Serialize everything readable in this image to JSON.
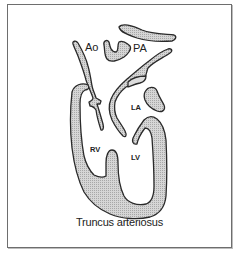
{
  "figure": {
    "caption": "Truncus arteriosus",
    "labels": {
      "aorta": "Ao",
      "pulmonary_artery": "PA",
      "left_atrium": "LA",
      "right_ventricle": "RV",
      "left_ventricle": "LV"
    },
    "colors": {
      "tissue_fill": "#c9c9c9",
      "outline": "#2a2a2a",
      "frame_border": "#6e6e6e"
    }
  }
}
